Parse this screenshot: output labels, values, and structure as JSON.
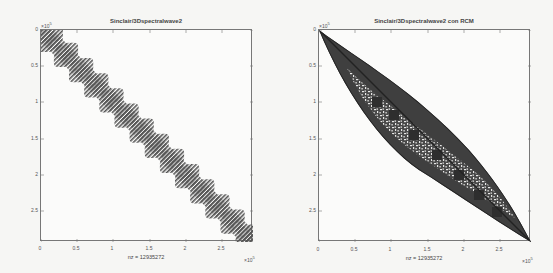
{
  "chart_data": [
    {
      "type": "heatmap",
      "subtype": "sparsity-pattern (spy plot)",
      "title": "Sinclair/3Dspectralwave2",
      "xlabel": "nz = 12935272",
      "ylabel": "",
      "x_exponent_label": "×10^5",
      "y_exponent_label": "×10^5",
      "xticks": [
        "0",
        "0.5",
        "1",
        "1.5",
        "2",
        "2.5"
      ],
      "yticks": [
        "0",
        "0.5",
        "1",
        "1.5",
        "2",
        "2.5"
      ],
      "xlim": [
        0,
        2.94
      ],
      "ylim": [
        2.94,
        0
      ],
      "matrix_size_approx": 294000,
      "nonzeros": 12935272,
      "pattern": "narrow block-banded diagonal with staircase bumps (~14 blocks)",
      "marker_color": "#555555"
    },
    {
      "type": "heatmap",
      "subtype": "sparsity-pattern (spy plot)",
      "title": "Sinclair/3Dspectralwave2 con RCM",
      "xlabel": "nz = 12935272",
      "ylabel": "",
      "x_exponent_label": "×10^5",
      "y_exponent_label": "×10^5",
      "xticks": [
        "0",
        "0.5",
        "1",
        "1.5",
        "2",
        "2.5"
      ],
      "yticks": [
        "0",
        "0.5",
        "1",
        "1.5",
        "2",
        "2.5"
      ],
      "xlim": [
        0,
        2.94
      ],
      "ylim": [
        2.94,
        0
      ],
      "matrix_size_approx": 294000,
      "nonzeros": 12935272,
      "pattern": "Reverse Cuthill-McKee reordered: lens-shaped band, thin at both ends, widest near 0.8–1.0×10^5, with checkered interior",
      "marker_color": "#3a3a3a"
    }
  ],
  "panels": [
    {
      "title": "Sinclair/3Dspectralwave2",
      "xlabel": "nz = 12935272",
      "exp": "×10",
      "exp_pow": "5"
    },
    {
      "title": "Sinclair/3Dspectralwave2 con RCM",
      "xlabel": "nz = 12935272",
      "exp": "×10",
      "exp_pow": "5"
    }
  ],
  "ticks": [
    "0",
    "0.5",
    "1",
    "1.5",
    "2",
    "2.5"
  ]
}
